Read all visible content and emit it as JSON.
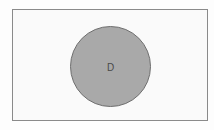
{
  "diagram": {
    "type": "venn",
    "universe": {
      "label": "",
      "fill": "#fafafa",
      "border": "#8a8a8a"
    },
    "sets": [
      {
        "label": "D",
        "fill": "#a9a9a9",
        "border": "#6e6e6e",
        "shaded": true
      }
    ]
  }
}
